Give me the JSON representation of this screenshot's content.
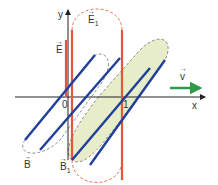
{
  "diagram": {
    "axes": {
      "x_label": "x",
      "y_label": "y"
    },
    "ticks": {
      "origin": "0",
      "one": "1"
    },
    "labels": {
      "E": "E",
      "E1": "E",
      "E1_sub": "1",
      "B": "B",
      "B1": "B",
      "B1_sub": "1",
      "v": "v"
    },
    "colors": {
      "E_field": "#e8553a",
      "B_field": "#1f3f9a",
      "velocity": "#2f9a4a",
      "loop_fill": "#e6edc8",
      "axis": "#222222"
    }
  }
}
